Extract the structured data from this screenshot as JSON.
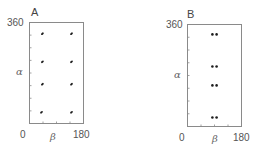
{
  "figure": {
    "panels": [
      {
        "label": "A",
        "ytick_top": "360",
        "xtick_left": "0",
        "xtick_right": "180",
        "xlabel": "β",
        "ylabel": "α"
      },
      {
        "label": "B",
        "ytick_top": "360",
        "xtick_left": "0",
        "xtick_right": "180",
        "xlabel": "β",
        "ylabel": "α"
      }
    ]
  },
  "colors": {
    "frame": "#8a8a8a",
    "points": "#1e1e1e",
    "text": "#555555"
  },
  "chart_data": [
    {
      "type": "scatter",
      "title": "A",
      "xlabel": "β",
      "ylabel": "α",
      "xlim": [
        0,
        180
      ],
      "ylim": [
        0,
        360
      ],
      "xticks_labeled": [
        0,
        180
      ],
      "yticks_labeled": [
        360
      ],
      "minor_tick_spacing_x": 45,
      "minor_tick_spacing_y": 45,
      "grid": false,
      "legend": null,
      "points": [
        {
          "x": 43,
          "y": 320
        },
        {
          "x": 140,
          "y": 320
        },
        {
          "x": 43,
          "y": 220
        },
        {
          "x": 140,
          "y": 220
        },
        {
          "x": 43,
          "y": 140
        },
        {
          "x": 140,
          "y": 140
        },
        {
          "x": 40,
          "y": 40
        },
        {
          "x": 140,
          "y": 40
        }
      ]
    },
    {
      "type": "scatter",
      "title": "B",
      "xlabel": "β",
      "ylabel": "α",
      "xlim": [
        0,
        180
      ],
      "ylim": [
        0,
        360
      ],
      "xticks_labeled": [
        0,
        180
      ],
      "yticks_labeled": [
        360
      ],
      "minor_tick_spacing_x": 45,
      "minor_tick_spacing_y": 45,
      "grid": false,
      "legend": null,
      "points": [
        {
          "x": 83,
          "y": 325
        },
        {
          "x": 97,
          "y": 325
        },
        {
          "x": 83,
          "y": 212
        },
        {
          "x": 97,
          "y": 212
        },
        {
          "x": 83,
          "y": 145
        },
        {
          "x": 97,
          "y": 145
        },
        {
          "x": 83,
          "y": 32
        },
        {
          "x": 97,
          "y": 32
        }
      ]
    }
  ]
}
